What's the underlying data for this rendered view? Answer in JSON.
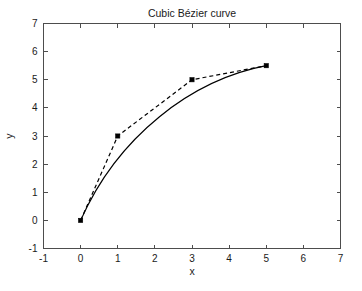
{
  "chart_data": {
    "type": "line",
    "title": "Cubic Bézier curve",
    "xlabel": "x",
    "ylabel": "y",
    "xlim": [
      -1,
      7
    ],
    "ylim": [
      -1,
      7
    ],
    "xticks": [
      -1,
      0,
      1,
      2,
      3,
      4,
      5,
      6,
      7
    ],
    "yticks": [
      -1,
      0,
      1,
      2,
      3,
      4,
      5,
      6,
      7
    ],
    "xticklabels": [
      "-1",
      "0",
      "1",
      "2",
      "3",
      "4",
      "5",
      "6",
      "7"
    ],
    "yticklabels": [
      "-1",
      "0",
      "1",
      "2",
      "3",
      "4",
      "5",
      "6",
      "7"
    ],
    "grid": false,
    "legend": null,
    "series": [
      {
        "name": "control polygon",
        "style": "dashed",
        "marker": "filled-square",
        "color": "#000000",
        "x": [
          0,
          1,
          3,
          5
        ],
        "y": [
          0,
          3,
          5,
          5.5
        ]
      },
      {
        "name": "cubic Bezier curve",
        "style": "solid",
        "marker": "none",
        "color": "#000000",
        "control_points": [
          [
            0,
            0
          ],
          [
            1,
            3
          ],
          [
            3,
            5
          ],
          [
            5,
            5.5
          ]
        ],
        "x": [
          0.0,
          0.25,
          0.5,
          0.75,
          1.0,
          1.25,
          1.5,
          1.75,
          2.0,
          2.25,
          2.5,
          2.75,
          3.0,
          3.25,
          3.5,
          3.75,
          4.0,
          4.25,
          4.5,
          4.75,
          5.0
        ],
        "y": [
          0.0,
          0.79,
          1.42,
          1.94,
          2.38,
          2.76,
          3.1,
          3.4,
          3.68,
          3.93,
          4.16,
          4.37,
          4.57,
          4.75,
          4.92,
          5.07,
          5.2,
          5.32,
          5.41,
          5.47,
          5.5
        ]
      }
    ],
    "control_points_labels": [
      "P0 (0, 0)",
      "P1 (1, 3)",
      "P2 (3, 5)",
      "P3 (5, 5.5)"
    ]
  },
  "figure": {
    "background_color": "#ffffff",
    "axes_color": "#4d4d4d",
    "line_color": "#000000"
  }
}
